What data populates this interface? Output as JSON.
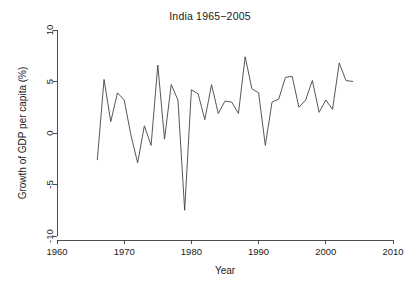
{
  "chart_data": {
    "type": "line",
    "title": "India 1965−2005",
    "xlabel": "Year",
    "ylabel": "Growth of GDP per capita (%)",
    "xlim": [
      1960,
      2010
    ],
    "ylim": [
      -10,
      10
    ],
    "xticks": [
      1960,
      1970,
      1980,
      1990,
      2000,
      2010
    ],
    "xtick_labels": [
      "1960",
      "1970",
      "1980",
      "1990",
      "2000",
      "2010"
    ],
    "yticks": [
      -10,
      -5,
      0,
      5,
      10
    ],
    "ytick_labels": [
      "-10",
      "-5",
      "0",
      "5",
      "10"
    ],
    "grid": false,
    "legend": false,
    "legend_position": "none",
    "line_color": "#444444",
    "background_color": "#ffffff",
    "axis_color": "#3b3b3b",
    "series": [
      {
        "name": "Growth of GDP per capita (%)",
        "x": [
          1966,
          1967,
          1968,
          1969,
          1970,
          1971,
          1972,
          1973,
          1974,
          1975,
          1976,
          1977,
          1978,
          1979,
          1980,
          1981,
          1982,
          1983,
          1984,
          1985,
          1986,
          1987,
          1988,
          1989,
          1990,
          1991,
          1992,
          1993,
          1994,
          1995,
          1996,
          1997,
          1998,
          1999,
          2000,
          2001,
          2002,
          2003,
          2004
        ],
        "values": [
          -2.6,
          5.2,
          1.1,
          3.9,
          3.2,
          -0.2,
          -2.9,
          0.7,
          -1.2,
          6.6,
          -0.6,
          4.7,
          3.2,
          -7.5,
          4.2,
          3.8,
          1.3,
          4.7,
          1.9,
          3.1,
          3.0,
          1.9,
          7.4,
          4.3,
          3.9,
          -1.2,
          3.0,
          3.3,
          5.4,
          5.5,
          2.5,
          3.2,
          5.1,
          2.0,
          3.2,
          2.3,
          6.8,
          5.1,
          5.0
        ]
      }
    ]
  },
  "plot_geometry": {
    "x_pixel_min": 57,
    "x_pixel_max": 393,
    "y_pixel_top": 30,
    "y_pixel_bottom": 236
  }
}
